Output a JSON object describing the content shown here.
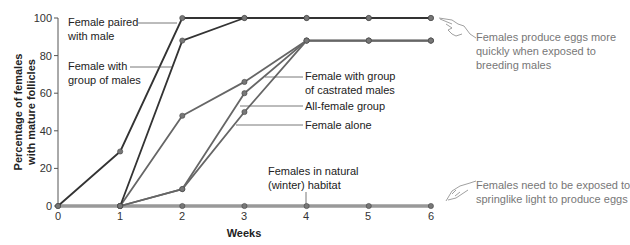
{
  "chart_data": {
    "type": "line",
    "title": "",
    "xlabel": "Weeks",
    "ylabel": "Percentage of females with mature follicles",
    "ylabel_lines": [
      "Percentage of females",
      "with mature follicles"
    ],
    "x": [
      0,
      1,
      2,
      3,
      4,
      5,
      6
    ],
    "x_ticks": [
      "0",
      "1",
      "2",
      "3",
      "4",
      "5",
      "6"
    ],
    "y_ticks": [
      "0",
      "20",
      "40",
      "60",
      "80",
      "100"
    ],
    "xlim": [
      0,
      6
    ],
    "ylim": [
      0,
      100
    ],
    "grid": false,
    "legend": "inline labels",
    "series": [
      {
        "name": "Female paired with male",
        "label_lines": [
          "Female paired",
          "with male"
        ],
        "color": "#333333",
        "x": [
          0,
          1,
          2,
          3,
          4,
          5,
          6
        ],
        "values": [
          0,
          29,
          100,
          100,
          100,
          100,
          100
        ]
      },
      {
        "name": "Female with group of males",
        "label_lines": [
          "Female with",
          "group of males"
        ],
        "color": "#333333",
        "x": [
          1,
          2,
          3,
          4,
          5,
          6
        ],
        "values": [
          0,
          88,
          100,
          100,
          100,
          100
        ]
      },
      {
        "name": "Female with group of castrated males",
        "label_lines": [
          "Female with group",
          "of castrated males"
        ],
        "color": "#666666",
        "x": [
          1,
          2,
          3,
          4,
          5,
          6
        ],
        "values": [
          0,
          48,
          66,
          88,
          88,
          88
        ]
      },
      {
        "name": "All-female group",
        "label_lines": [
          "All-female group"
        ],
        "color": "#666666",
        "x": [
          1,
          2,
          3,
          4,
          5,
          6
        ],
        "values": [
          0,
          9,
          60,
          88,
          88,
          88
        ]
      },
      {
        "name": "Female alone",
        "label_lines": [
          "Female alone"
        ],
        "color": "#666666",
        "x": [
          1,
          2,
          3,
          4,
          5,
          6
        ],
        "values": [
          0,
          9,
          50,
          88,
          88,
          88
        ]
      },
      {
        "name": "Females in natural (winter) habitat",
        "label_lines": [
          "Females in natural",
          "(winter) habitat"
        ],
        "color": "#999999",
        "x": [
          0,
          1,
          2,
          3,
          4,
          5,
          6
        ],
        "values": [
          0,
          0,
          0,
          0,
          0,
          0,
          0
        ]
      }
    ],
    "annotations": [
      {
        "text": "Females produce eggs more quickly when exposed to breeding males",
        "lines": [
          "Females produce eggs more",
          "quickly when exposed to",
          "breeding males"
        ],
        "icon": "pointing-hand-icon"
      },
      {
        "text": "Females need to be exposed to springlike light to produce eggs",
        "lines": [
          "Females need to be exposed to",
          "springlike light to produce eggs"
        ],
        "icon": "pointing-hand-icon"
      }
    ]
  }
}
